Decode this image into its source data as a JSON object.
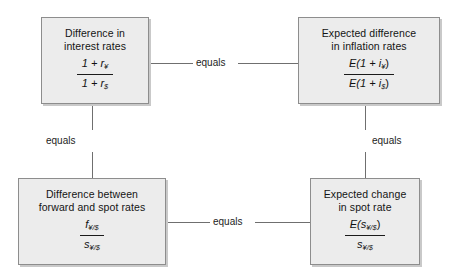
{
  "diagram": {
    "nodes": [
      {
        "id": "interest-rates",
        "title": "Difference in\ninterest rates",
        "fraction": {
          "numerator": "1 + r",
          "numerator_sub": "¥",
          "denominator": "1 + r",
          "denominator_sub": "$"
        }
      },
      {
        "id": "inflation-rates",
        "title": "Expected difference\nin inflation rates",
        "fraction": {
          "numerator": "E(1 + i",
          "numerator_sub": "¥",
          "numerator_tail": ")",
          "denominator": "E(1 + i",
          "denominator_sub": "$",
          "denominator_tail": ")"
        }
      },
      {
        "id": "forward-spot-rates",
        "title": "Difference between\nforward and spot rates",
        "fraction": {
          "numerator": "f",
          "numerator_sub": "¥/$",
          "denominator": "s",
          "denominator_sub": "¥/$"
        }
      },
      {
        "id": "expected-spot-rate",
        "title": "Expected change\nin spot rate",
        "fraction": {
          "numerator": "E(s",
          "numerator_sub": "¥/$",
          "numerator_tail": ")",
          "denominator": "s",
          "denominator_sub": "¥/$"
        }
      }
    ],
    "connectors": [
      {
        "id": "top-horizontal",
        "label": "equals"
      },
      {
        "id": "left-vertical",
        "label": "equals"
      },
      {
        "id": "right-vertical",
        "label": "equals"
      },
      {
        "id": "bottom-horizontal",
        "label": "equals"
      }
    ],
    "colors": {
      "box_fill": "#ececec",
      "box_border": "#8d8d8d",
      "connector": "#6f6f6f",
      "text": "#141414",
      "background": "#ffffff"
    }
  }
}
